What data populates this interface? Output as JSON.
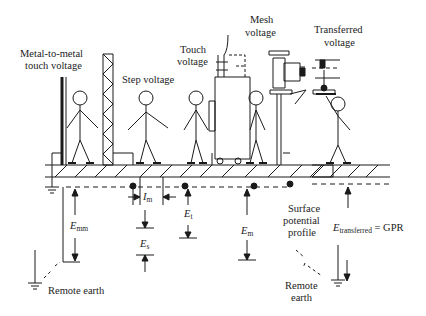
{
  "diagram": {
    "title_labels": {
      "metal_to_metal": [
        "Metal-to-metal",
        "touch voltage"
      ],
      "step": "Step voltage",
      "touch": [
        "Touch",
        "voltage"
      ],
      "mesh": [
        "Mesh",
        "voltage"
      ],
      "transferred": [
        "Transferred",
        "voltage"
      ]
    },
    "quantities": {
      "e_mm": {
        "symbol": "E",
        "subscript": "mm"
      },
      "i_m": {
        "symbol": "I",
        "subscript": "m"
      },
      "e_t": {
        "symbol": "E",
        "subscript": "t"
      },
      "e_s": {
        "symbol": "E",
        "subscript": "s"
      },
      "e_m": {
        "symbol": "E",
        "subscript": "m"
      },
      "e_transferred": {
        "symbol": "E",
        "subscript": "transferred",
        "suffix": " = GPR"
      }
    },
    "annotations": {
      "remote_earth_left": "Remote earth",
      "surface_profile": [
        "Surface",
        "potential",
        "profile"
      ],
      "remote_earth_right": [
        "Remote",
        "earth"
      ]
    },
    "colors": {
      "stroke": "#1a1a1a",
      "text": "#222222",
      "background": "#ffffff"
    }
  }
}
